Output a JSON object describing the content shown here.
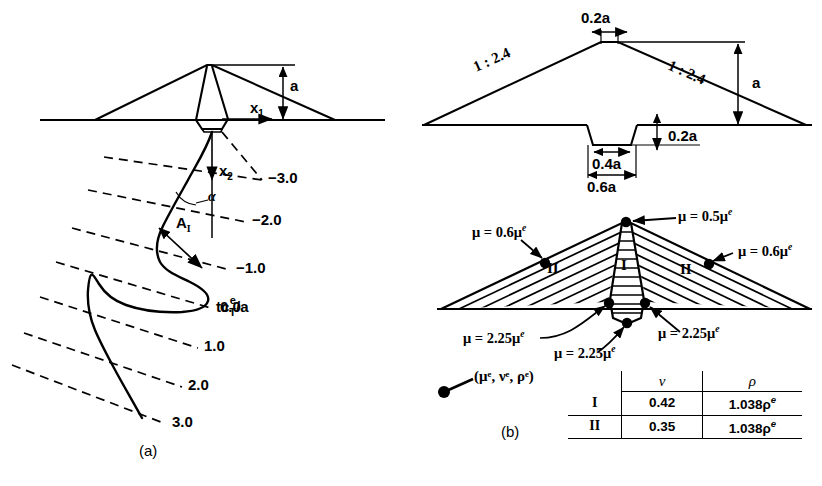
{
  "figure": {
    "panel_a": {
      "tag": "(a)",
      "height_label": "a",
      "axis_x1": "x",
      "axis_x1_sub": "1",
      "axis_x2": "x",
      "axis_x2_sub": "2",
      "angle_label": "α",
      "amplitude_label": "A",
      "amplitude_sub": "I",
      "time_label": {
        "prefix": "tc",
        "num": "e",
        "den": "T",
        "suffix": "/a"
      },
      "ray_labels": [
        "−3.0",
        "−2.0",
        "−1.0",
        "0.0",
        "1.0",
        "2.0",
        "3.0"
      ]
    },
    "panel_b": {
      "tag": "(b)",
      "crest_width": "0.2a",
      "slope_left": "1 : 2.4",
      "slope_right": "1 : 2.4",
      "height_label": "a",
      "notch_depth": "0.2a",
      "notch_bottom_width": "0.4a",
      "notch_top_width": "0.6a",
      "zone_labels": [
        "I",
        "II",
        "II"
      ],
      "mu_annotations": [
        {
          "name": "crest",
          "text": "μ = 0.5μ",
          "sup": "e"
        },
        {
          "name": "left-slope",
          "text": "μ = 0.6μ",
          "sup": "e"
        },
        {
          "name": "right-slope",
          "text": "μ = 0.6μ",
          "sup": "e"
        },
        {
          "name": "left-toe",
          "text": "μ = 2.25μ",
          "sup": "e"
        },
        {
          "name": "base-center",
          "text": "μ = 2.25μ",
          "sup": "e"
        },
        {
          "name": "right-toe",
          "text": "μ = 2.25μ",
          "sup": "e"
        }
      ],
      "legend": {
        "text": "(μ",
        "full": "(μᵉ, νᵉ, ρᵉ)"
      },
      "table": {
        "columns": [
          "",
          "ν",
          "ρ"
        ],
        "rows": [
          {
            "zone": "I",
            "nu": "0.42",
            "rho": "1.038ρ",
            "rho_sup": "e"
          },
          {
            "zone": "II",
            "nu": "0.35",
            "rho": "1.038ρ",
            "rho_sup": "e"
          }
        ]
      }
    }
  },
  "colors": {
    "ink": "#000000",
    "background": "#ffffff"
  }
}
